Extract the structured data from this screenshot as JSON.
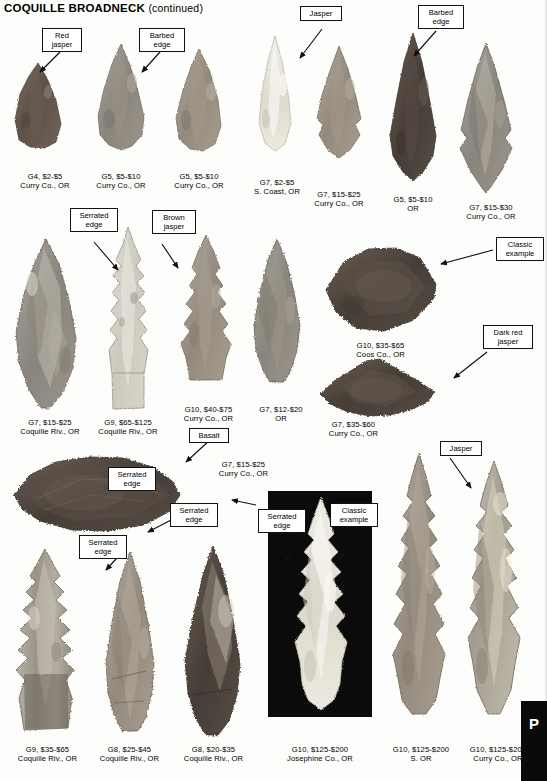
{
  "header": {
    "title": "COQUILLE BROADNECK",
    "continued": "(continued)"
  },
  "edge_tab": {
    "letter": "P"
  },
  "callouts": [
    {
      "name": "red-jasper",
      "lines": [
        "Red",
        "jasper"
      ]
    },
    {
      "name": "barbed-edge-1",
      "lines": [
        "Barbed",
        "edge"
      ]
    },
    {
      "name": "jasper-top",
      "lines": [
        "Jasper"
      ]
    },
    {
      "name": "barbed-edge-2",
      "lines": [
        "Barbed",
        "edge"
      ]
    },
    {
      "name": "serrated-edge-1",
      "lines": [
        "Serrated",
        "edge"
      ]
    },
    {
      "name": "brown-jasper",
      "lines": [
        "Brown",
        "jasper"
      ]
    },
    {
      "name": "classic-example-1",
      "lines": [
        "Classic",
        "example"
      ]
    },
    {
      "name": "dark-red-jasper",
      "lines": [
        "Dark red",
        "jasper"
      ]
    },
    {
      "name": "basalt",
      "lines": [
        "Basalt"
      ]
    },
    {
      "name": "serrated-edge-2",
      "lines": [
        "Serrated",
        "edge"
      ]
    },
    {
      "name": "serrated-edge-3",
      "lines": [
        "Serrated",
        "edge"
      ]
    },
    {
      "name": "serrated-edge-4",
      "lines": [
        "Serrated",
        "edge"
      ]
    },
    {
      "name": "serrated-edge-5",
      "lines": [
        "Serrated",
        "edge"
      ]
    },
    {
      "name": "classic-example-2",
      "lines": [
        "Classic",
        "example"
      ]
    },
    {
      "name": "jasper-bottom",
      "lines": [
        "Jasper"
      ]
    }
  ],
  "specimens": [
    {
      "name": "row1-item1",
      "grade_price": "G4, $2-$5",
      "provenance": "Curry Co., OR"
    },
    {
      "name": "row1-item2",
      "grade_price": "G5, $5-$10",
      "provenance": "Curry Co., OR"
    },
    {
      "name": "row1-item3",
      "grade_price": "G5, $5-$10",
      "provenance": "Curry Co., OR"
    },
    {
      "name": "row1-item4",
      "grade_price": "G7, $2-$5",
      "provenance": "S. Coast, OR"
    },
    {
      "name": "row1-item5",
      "grade_price": "G7, $15-$25",
      "provenance": "Curry Co., OR"
    },
    {
      "name": "row1-item6",
      "grade_price": "G5, $5-$10",
      "provenance": "OR"
    },
    {
      "name": "row1-item7",
      "grade_price": "G7, $15-$30",
      "provenance": "Curry Co., OR"
    },
    {
      "name": "row2-item1",
      "grade_price": "G7, $15-$25",
      "provenance": "Coquille Riv., OR"
    },
    {
      "name": "row2-item2",
      "grade_price": "G9, $65-$125",
      "provenance": "Coquille Riv., OR"
    },
    {
      "name": "row2-item3",
      "grade_price": "G10, $40-$75",
      "provenance": "Curry Co., OR"
    },
    {
      "name": "row2-item4",
      "grade_price": "G7, $12-$20",
      "provenance": "OR"
    },
    {
      "name": "row2-item5",
      "grade_price": "G10, $35-$65",
      "provenance": "Coos Co., OR"
    },
    {
      "name": "row2-item6",
      "grade_price": "G7, $35-$60",
      "provenance": "Curry Co., OR"
    },
    {
      "name": "row3-item1",
      "grade_price": "G7, $15-$25",
      "provenance": "Curry Co., OR"
    },
    {
      "name": "row4-item1",
      "grade_price": "G9, $35-$65",
      "provenance": "Coquille Riv., OR"
    },
    {
      "name": "row4-item2",
      "grade_price": "G8, $25-$45",
      "provenance": "Coquille Riv., OR"
    },
    {
      "name": "row4-item3",
      "grade_price": "G8, $20-$35",
      "provenance": "Coquille Riv., OR"
    },
    {
      "name": "row4-item4",
      "grade_price": "G10, $125-$200",
      "provenance": "Josephine Co., OR"
    },
    {
      "name": "row4-item5",
      "grade_price": "G10, $125-$200",
      "provenance": "S. OR"
    },
    {
      "name": "row4-item6",
      "grade_price": "G10, $125-$200",
      "provenance": "Curry Co., OR"
    }
  ]
}
